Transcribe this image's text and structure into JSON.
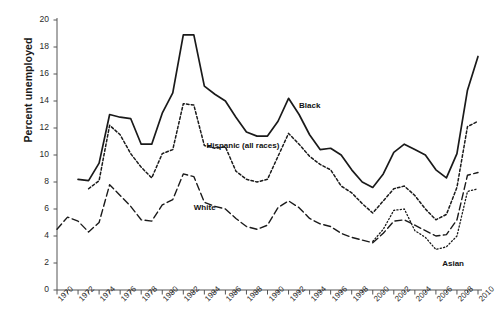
{
  "chart_data": {
    "type": "line",
    "title": "",
    "xlabel": "",
    "ylabel": "Percent unemployed",
    "ylim": [
      0,
      20
    ],
    "xlim": [
      1970,
      2010
    ],
    "ytick_step": 2,
    "xtick_step": 2,
    "grid": false,
    "legend_position": "inline-labels",
    "ytick_labels": [
      "0",
      "2",
      "4",
      "6",
      "8",
      "10",
      "12",
      "14",
      "16",
      "18",
      "20"
    ],
    "xtick_labels": [
      "1970",
      "1972",
      "1974",
      "1976",
      "1978",
      "1980",
      "1982",
      "1984",
      "1986",
      "1988",
      "1990",
      "1992",
      "1994",
      "1996",
      "1998",
      "2000",
      "2002",
      "2004",
      "2006",
      "2008",
      "2010"
    ],
    "series": [
      {
        "name": "Black",
        "label": "Black",
        "linestyle": "solid",
        "color": "#1a1a1a",
        "x": [
          1972,
          1973,
          1974,
          1975,
          1976,
          1977,
          1978,
          1979,
          1980,
          1981,
          1982,
          1983,
          1984,
          1985,
          1986,
          1987,
          1988,
          1989,
          1990,
          1991,
          1992,
          1993,
          1994,
          1995,
          1996,
          1997,
          1998,
          1999,
          2000,
          2001,
          2002,
          2003,
          2004,
          2005,
          2006,
          2007,
          2008,
          2009,
          2010
        ],
        "y": [
          8.2,
          8.1,
          9.4,
          13.0,
          12.8,
          12.7,
          10.8,
          10.8,
          13.1,
          14.6,
          18.9,
          18.9,
          15.1,
          14.5,
          14.0,
          12.8,
          11.7,
          11.4,
          11.4,
          12.5,
          14.2,
          13.0,
          11.5,
          10.4,
          10.5,
          10.0,
          8.9,
          8.0,
          7.6,
          8.6,
          10.2,
          10.8,
          10.4,
          10.0,
          8.9,
          8.3,
          10.1,
          14.8,
          17.3
        ]
      },
      {
        "name": "Hispanic (all races)",
        "label": "Hispanic (all races)",
        "linestyle": "dotted",
        "color": "#1a1a1a",
        "x": [
          1973,
          1974,
          1975,
          1976,
          1977,
          1978,
          1979,
          1980,
          1981,
          1982,
          1983,
          1984,
          1985,
          1986,
          1987,
          1988,
          1989,
          1990,
          1991,
          1992,
          1993,
          1994,
          1995,
          1996,
          1997,
          1998,
          1999,
          2000,
          2001,
          2002,
          2003,
          2004,
          2005,
          2006,
          2007,
          2008,
          2009,
          2010
        ],
        "y": [
          7.5,
          8.1,
          12.2,
          11.5,
          10.1,
          9.1,
          8.3,
          10.1,
          10.4,
          13.8,
          13.7,
          10.7,
          10.5,
          10.6,
          8.8,
          8.2,
          8.0,
          8.2,
          9.9,
          11.6,
          10.8,
          9.9,
          9.3,
          8.9,
          7.7,
          7.2,
          6.4,
          5.7,
          6.6,
          7.5,
          7.7,
          7.0,
          6.0,
          5.2,
          5.6,
          7.6,
          12.1,
          12.5
        ]
      },
      {
        "name": "White",
        "label": "White",
        "linestyle": "dashed",
        "color": "#1a1a1a",
        "x": [
          1970,
          1971,
          1972,
          1973,
          1974,
          1975,
          1976,
          1977,
          1978,
          1979,
          1980,
          1981,
          1982,
          1983,
          1984,
          1985,
          1986,
          1987,
          1988,
          1989,
          1990,
          1991,
          1992,
          1993,
          1994,
          1995,
          1996,
          1997,
          1998,
          1999,
          2000,
          2001,
          2002,
          2003,
          2004,
          2005,
          2006,
          2007,
          2008,
          2009,
          2010
        ],
        "y": [
          4.5,
          5.4,
          5.1,
          4.3,
          5.0,
          7.8,
          7.0,
          6.2,
          5.2,
          5.1,
          6.3,
          6.7,
          8.6,
          8.4,
          6.5,
          6.2,
          6.0,
          5.3,
          4.7,
          4.5,
          4.8,
          6.1,
          6.6,
          6.1,
          5.3,
          4.9,
          4.7,
          4.2,
          3.9,
          3.7,
          3.5,
          4.2,
          5.1,
          5.2,
          4.8,
          4.4,
          4.0,
          4.1,
          5.2,
          8.5,
          8.7
        ]
      },
      {
        "name": "Asian",
        "label": "Asian",
        "linestyle": "fine-dotted",
        "color": "#1a1a1a",
        "x": [
          2000,
          2001,
          2002,
          2003,
          2004,
          2005,
          2006,
          2007,
          2008,
          2009,
          2010
        ],
        "y": [
          3.6,
          4.5,
          5.9,
          6.0,
          4.4,
          3.9,
          3.0,
          3.2,
          4.0,
          7.3,
          7.5
        ]
      }
    ],
    "annotations": [
      {
        "text": "Black",
        "x": 1993.0,
        "y": 13.6
      },
      {
        "text": "Hispanic (all races)",
        "x": 1984.2,
        "y": 10.7
      },
      {
        "text": "White",
        "x": 1983.0,
        "y": 6.1
      },
      {
        "text": "Asian",
        "x": 2006.6,
        "y": 1.9
      }
    ]
  }
}
